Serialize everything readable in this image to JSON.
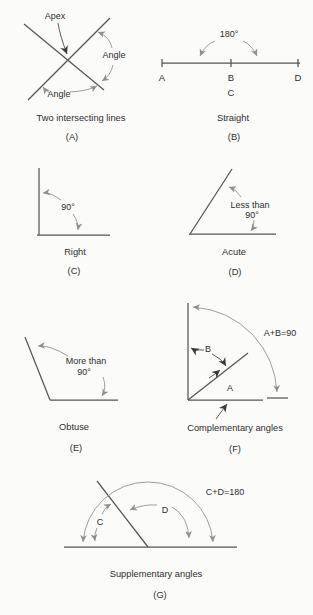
{
  "figure": {
    "background": "#fbfbf9",
    "colors": {
      "line": "#555552",
      "arc": "#949490",
      "text": "#2e2e2e"
    },
    "panels": {
      "a": {
        "caption": "Two intersecting lines",
        "tag": "(A)",
        "labels": {
          "apex": "Apex",
          "angle_right": "Angle",
          "angle_bottom": "Angle"
        }
      },
      "b": {
        "caption": "Straight",
        "tag": "(B)",
        "labels": {
          "degrees": "180°",
          "point_a": "A",
          "point_b": "B",
          "point_c": "C",
          "point_d": "D"
        }
      },
      "c": {
        "caption": "Right",
        "tag": "(C)",
        "labels": {
          "degrees": "90°"
        }
      },
      "d": {
        "caption": "Acute",
        "tag": "(D)",
        "labels": {
          "size_line1": "Less than",
          "size_line2": "90°"
        }
      },
      "e": {
        "caption": "Obtuse",
        "tag": "(E)",
        "labels": {
          "size_line1": "More than",
          "size_line2": "90°"
        }
      },
      "f": {
        "caption": "Complementary angles",
        "tag": "(F)",
        "labels": {
          "angle_a": "A",
          "angle_b": "B",
          "equation": "A+B=90"
        }
      },
      "g": {
        "caption": "Supplementary angles",
        "tag": "(G)",
        "labels": {
          "angle_c": "C",
          "angle_d": "D",
          "equation": "C+D=180"
        }
      }
    }
  }
}
